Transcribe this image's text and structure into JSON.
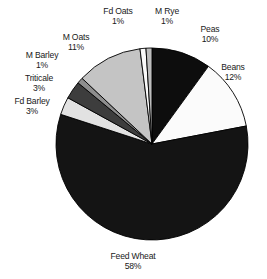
{
  "chart_data": {
    "type": "pie",
    "title": "",
    "subtitle": "",
    "xlabel": "",
    "ylabel": "",
    "legend_position": "none",
    "grid": false,
    "units": "percent",
    "total": 100,
    "start_angle_deg": 0,
    "direction": "clockwise",
    "categories": [
      "Peas",
      "Beans",
      "Feed Wheat",
      "Fd Barley",
      "Triticale",
      "M Barley",
      "M Oats",
      "Fd Oats",
      "M Rye"
    ],
    "values": [
      10,
      12,
      58,
      3,
      3,
      1,
      11,
      1,
      1
    ],
    "slices": [
      {
        "name": "Peas",
        "value": 10,
        "pct_label": "10%",
        "color": "#0d0d0d",
        "stroke": "#000000"
      },
      {
        "name": "Beans",
        "value": 12,
        "pct_label": "12%",
        "color": "#fbfbfb",
        "stroke": "#000000"
      },
      {
        "name": "Feed Wheat",
        "value": 58,
        "pct_label": "58%",
        "color": "#141414",
        "stroke": "#000000"
      },
      {
        "name": "Fd Barley",
        "value": 3,
        "pct_label": "3%",
        "color": "#e2e2e2",
        "stroke": "#000000"
      },
      {
        "name": "Triticale",
        "value": 3,
        "pct_label": "3%",
        "color": "#3d3d3d",
        "stroke": "#000000"
      },
      {
        "name": "M Barley",
        "value": 1,
        "pct_label": "1%",
        "color": "#8e8e8e",
        "stroke": "#000000"
      },
      {
        "name": "M Oats",
        "value": 11,
        "pct_label": "11%",
        "color": "#c4c4c4",
        "stroke": "#000000"
      },
      {
        "name": "Fd Oats",
        "value": 1,
        "pct_label": "1%",
        "color": "#fbfbfb",
        "stroke": "#000000"
      },
      {
        "name": "M Rye",
        "value": 1,
        "pct_label": "1%",
        "color": "#bdbdbd",
        "stroke": "#000000"
      }
    ],
    "background_color": "#ffffff"
  },
  "labels": [
    {
      "name": "Fd Oats",
      "pct": "1%",
      "x": 118,
      "y": 6
    },
    {
      "name": "M Rye",
      "pct": "1%",
      "x": 167,
      "y": 6
    },
    {
      "name": "Peas",
      "pct": "10%",
      "x": 210,
      "y": 24
    },
    {
      "name": "M Oats",
      "pct": "11%",
      "x": 76,
      "y": 32
    },
    {
      "name": "Beans",
      "pct": "12%",
      "x": 233,
      "y": 62
    },
    {
      "name": "M Barley",
      "pct": "1%",
      "x": 42,
      "y": 50
    },
    {
      "name": "Triticale",
      "pct": "3%",
      "x": 39,
      "y": 73
    },
    {
      "name": "Fd Barley",
      "pct": "3%",
      "x": 32,
      "y": 96
    },
    {
      "name": "Feed Wheat",
      "pct": "58%",
      "x": 133,
      "y": 251
    }
  ]
}
